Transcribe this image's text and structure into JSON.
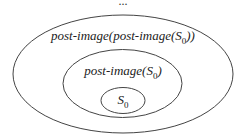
{
  "diagram": {
    "ellipsis": "...",
    "outer": {
      "label_text": "post-image(post-image(",
      "label_sym": "S",
      "label_sub": "0",
      "label_tail": "))"
    },
    "middle": {
      "label_text": "post-image(",
      "label_sym": "S",
      "label_sub": "0",
      "label_tail": ")"
    },
    "inner": {
      "label_sym": "S",
      "label_sub": "0"
    },
    "stroke_color": "#444444"
  }
}
